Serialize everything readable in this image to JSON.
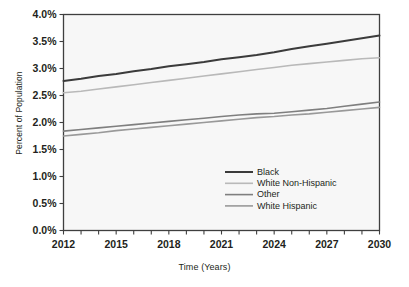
{
  "chart_data": {
    "type": "line",
    "title": "",
    "xlabel": "Time (Years)",
    "ylabel": "Percent of Population",
    "xlim": [
      2012,
      2030
    ],
    "ylim": [
      0.0,
      4.0
    ],
    "grid": false,
    "legend_position": "center-right-inside",
    "x": [
      2012,
      2013,
      2014,
      2015,
      2016,
      2017,
      2018,
      2019,
      2020,
      2021,
      2022,
      2023,
      2024,
      2025,
      2026,
      2027,
      2028,
      2029,
      2030
    ],
    "x_tick_labels": [
      "2012",
      "2015",
      "2018",
      "2021",
      "2024",
      "2027",
      "2030"
    ],
    "x_tick_values": [
      2012,
      2015,
      2018,
      2021,
      2024,
      2027,
      2030
    ],
    "x_minor_tick_values": [
      2012,
      2013,
      2014,
      2015,
      2016,
      2017,
      2018,
      2019,
      2020,
      2021,
      2022,
      2023,
      2024,
      2025,
      2026,
      2027,
      2028,
      2029,
      2030
    ],
    "y_tick_labels": [
      "0.0%",
      "0.5%",
      "1.0%",
      "1.5%",
      "2.0%",
      "2.5%",
      "3.0%",
      "3.5%",
      "4.0%"
    ],
    "y_tick_values": [
      0.0,
      0.5,
      1.0,
      1.5,
      2.0,
      2.5,
      3.0,
      3.5,
      4.0
    ],
    "series": [
      {
        "name": "Black",
        "color": "#3b3b3b",
        "width": 2.0,
        "values": [
          2.77,
          2.81,
          2.86,
          2.9,
          2.95,
          2.99,
          3.04,
          3.08,
          3.12,
          3.17,
          3.21,
          3.25,
          3.3,
          3.36,
          3.41,
          3.46,
          3.51,
          3.56,
          3.61
        ]
      },
      {
        "name": "White Non-Hispanic",
        "color": "#b9b9b9",
        "width": 1.6,
        "values": [
          2.55,
          2.58,
          2.62,
          2.66,
          2.7,
          2.74,
          2.78,
          2.82,
          2.86,
          2.9,
          2.94,
          2.98,
          3.02,
          3.06,
          3.09,
          3.12,
          3.15,
          3.18,
          3.2
        ]
      },
      {
        "name": "Other",
        "color": "#7f7f7f",
        "width": 1.6,
        "values": [
          1.84,
          1.87,
          1.9,
          1.93,
          1.96,
          1.99,
          2.02,
          2.05,
          2.08,
          2.11,
          2.14,
          2.16,
          2.17,
          2.2,
          2.23,
          2.26,
          2.3,
          2.34,
          2.38
        ]
      },
      {
        "name": "White Hispanic",
        "color": "#999999",
        "width": 1.6,
        "values": [
          1.75,
          1.78,
          1.81,
          1.85,
          1.88,
          1.91,
          1.94,
          1.97,
          2.0,
          2.03,
          2.06,
          2.09,
          2.11,
          2.14,
          2.16,
          2.19,
          2.22,
          2.25,
          2.28
        ]
      }
    ]
  },
  "legend": {
    "entries": [
      {
        "label": "Black"
      },
      {
        "label": "White Non-Hispanic"
      },
      {
        "label": "Other"
      },
      {
        "label": "White Hispanic"
      }
    ]
  },
  "style": {
    "plot_background": "#f7f7f7",
    "plot_border": "#3f3f3f",
    "page_background": "#ffffff",
    "text_color": "#231f20"
  }
}
